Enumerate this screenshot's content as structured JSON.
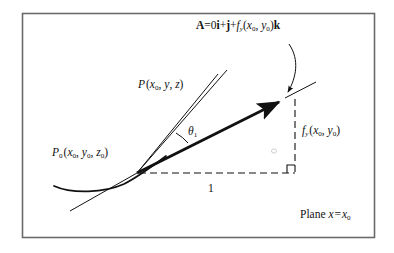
{
  "figure": {
    "type": "geometric-diagram",
    "topic": "tangent vector to a surface in the plane x = x0",
    "frame": {
      "stroke": "#555555",
      "fill": "#ffffff"
    },
    "ink": "#111111",
    "labels": {
      "vector_equation": "A = 0i + j + fᵧ(x₀, y₀) k",
      "point_P": "P (x₀, y, z)",
      "point_P0": "P₀ (x₀, y₀, z₀)",
      "angle": "θ₁",
      "rise": "fᵧ (x₀, y₀)",
      "run": "1",
      "plane": "Plane x = x₀"
    },
    "parts": {
      "vector_equation": {
        "bold_A": "A",
        "equals": "=",
        "zero_i": "0",
        "i": "i",
        "plus1": "+",
        "j": "j",
        "plus2": "+",
        "f": "f",
        "f_sub": "y",
        "args_open": "(",
        "x0": "x",
        "x0_sub": "0",
        "comma": ", ",
        "y0": "y",
        "y0_sub": "0",
        "args_close": ")",
        "k": "k"
      },
      "point_P": {
        "P": "P",
        "open": "(",
        "x": "x",
        "x_sub": "0",
        "c1": ", ",
        "y": "y",
        "c2": ", ",
        "z": "z",
        "close": ")"
      },
      "point_P0": {
        "P": "P",
        "P_sub": "0",
        "open": "(",
        "x": "x",
        "x_sub": "0",
        "c1": ", ",
        "y": "y",
        "y_sub": "0",
        "c2": ", ",
        "z": "z",
        "z_sub": "0",
        "close": ")"
      },
      "angle": {
        "theta": "θ",
        "sub": "1"
      },
      "rise": {
        "f": "f",
        "f_sub": "y",
        "open": "(",
        "x": "x",
        "x_sub": "0",
        "comma": ", ",
        "y": "y",
        "y_sub": "0",
        "close": ")"
      },
      "plane": {
        "word": "Plane",
        "x": "x",
        "eq": "=",
        "x0": "x",
        "x0_sub": "0"
      }
    },
    "geometry": {
      "origin_point": [
        137,
        173
      ],
      "arrow_tip": [
        285,
        98
      ],
      "corner_point": [
        295,
        173
      ],
      "secant_top": [
        227,
        70
      ]
    }
  }
}
